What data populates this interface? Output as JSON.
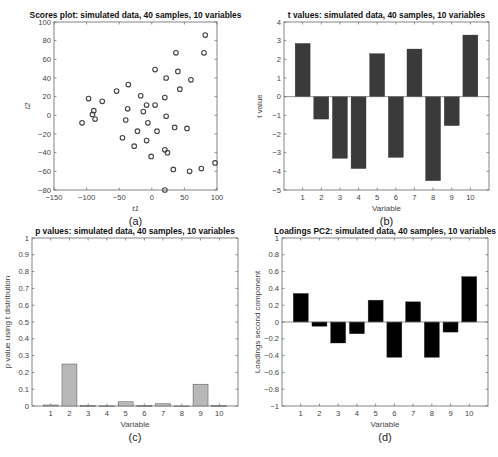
{
  "figure": {
    "panels": [
      "(a)",
      "(b)",
      "(c)",
      "(d)"
    ]
  },
  "chart_data": [
    {
      "id": "a",
      "type": "scatter",
      "title": "Scores plot: simulated data, 40 samples, 10 variables",
      "xlabel": "t1",
      "ylabel": "t2",
      "caption": "(a)",
      "xlim": [
        -150,
        100
      ],
      "ylim": [
        -80,
        100
      ],
      "xticks": [
        -150,
        -100,
        -50,
        0,
        50,
        100
      ],
      "yticks": [
        -80,
        -60,
        -40,
        -20,
        0,
        20,
        40,
        60,
        80,
        100
      ],
      "marker": "open-circle",
      "grid": false,
      "points": [
        [
          -97,
          18
        ],
        [
          -89,
          5
        ],
        [
          -91,
          1
        ],
        [
          -87,
          -4
        ],
        [
          -107,
          -8
        ],
        [
          -76,
          15
        ],
        [
          -54,
          26
        ],
        [
          -36,
          33
        ],
        [
          -37,
          7
        ],
        [
          -40,
          -5
        ],
        [
          -45,
          -24
        ],
        [
          -22,
          -17
        ],
        [
          -27,
          -33
        ],
        [
          -17,
          21
        ],
        [
          -13,
          4
        ],
        [
          -8,
          11
        ],
        [
          -6,
          -8
        ],
        [
          -8,
          -27
        ],
        [
          -1,
          -44
        ],
        [
          5,
          49
        ],
        [
          5,
          11
        ],
        [
          8,
          -17
        ],
        [
          22,
          40
        ],
        [
          20,
          19
        ],
        [
          22,
          -1
        ],
        [
          20,
          -37
        ],
        [
          24,
          -40
        ],
        [
          35,
          -13
        ],
        [
          33,
          -58
        ],
        [
          37,
          67
        ],
        [
          40,
          47
        ],
        [
          43,
          28
        ],
        [
          54,
          -14
        ],
        [
          58,
          -60
        ],
        [
          60,
          38
        ],
        [
          76,
          -57
        ],
        [
          80,
          67
        ],
        [
          82,
          86
        ],
        [
          97,
          -51
        ],
        [
          20,
          -80
        ]
      ]
    },
    {
      "id": "b",
      "type": "bar",
      "title": "t values: simulated data, 40 samples, 10 variables",
      "xlabel": "Variable",
      "ylabel": "t value",
      "caption": "(b)",
      "categories": [
        "1",
        "2",
        "3",
        "4",
        "5",
        "6",
        "7",
        "8",
        "9",
        "10"
      ],
      "values": [
        2.85,
        -1.2,
        -3.3,
        -3.85,
        2.3,
        -3.25,
        2.55,
        -4.5,
        -1.55,
        3.3
      ],
      "ylim": [
        -5,
        4
      ],
      "yticks": [
        -5,
        -4,
        -3,
        -2,
        -1,
        0,
        1,
        2,
        3,
        4
      ],
      "bar_color": "#3a3a3a"
    },
    {
      "id": "c",
      "type": "bar",
      "title": "p values: simulated data, 40 samples, 10 variables",
      "xlabel": "Variable",
      "ylabel": "p value using t distribution",
      "caption": "(c)",
      "categories": [
        "1",
        "2",
        "3",
        "4",
        "5",
        "6",
        "7",
        "8",
        "9",
        "10"
      ],
      "values": [
        0.006,
        0.25,
        0.002,
        0.0004,
        0.025,
        0.002,
        0.013,
        2e-05,
        0.13,
        0.002
      ],
      "ylim": [
        0,
        1
      ],
      "yticks": [
        0,
        0.1,
        0.2,
        0.3,
        0.4,
        0.5,
        0.6,
        0.7,
        0.8,
        0.9,
        1
      ],
      "bar_color": "#b8b8b8"
    },
    {
      "id": "d",
      "type": "bar",
      "title": "Loadings PC2: simulated data, 40 samples, 10 variables",
      "xlabel": "Variable",
      "ylabel": "Loadings second component",
      "caption": "(d)",
      "categories": [
        "1",
        "2",
        "3",
        "4",
        "5",
        "6",
        "7",
        "8",
        "9",
        "10"
      ],
      "values": [
        0.34,
        -0.05,
        -0.25,
        -0.14,
        0.26,
        -0.42,
        0.24,
        -0.42,
        -0.12,
        0.54
      ],
      "ylim": [
        -1,
        1
      ],
      "yticks": [
        -1,
        -0.8,
        -0.6,
        -0.4,
        -0.2,
        0,
        0.2,
        0.4,
        0.6,
        0.8,
        1
      ],
      "bar_color": "#000000"
    }
  ]
}
